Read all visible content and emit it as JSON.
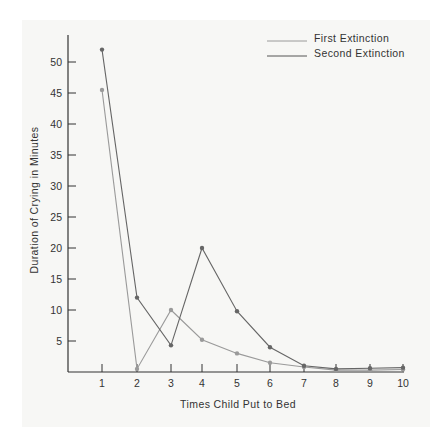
{
  "chart_data": {
    "type": "line",
    "title": "",
    "xlabel": "Times Child Put to Bed",
    "ylabel": "Duration of Crying in Minutes",
    "x": [
      1,
      2,
      3,
      4,
      5,
      6,
      7,
      8,
      9,
      10
    ],
    "x_ticks": [
      "1",
      "2",
      "3",
      "4",
      "5",
      "6",
      "7",
      "8",
      "9",
      "10"
    ],
    "y_ticks": [
      "5",
      "10",
      "15",
      "20",
      "25",
      "30",
      "35",
      "40",
      "45",
      "50"
    ],
    "ylim": [
      0,
      54
    ],
    "xlim": [
      0,
      10
    ],
    "grid": false,
    "legend_position": "top-right",
    "series": [
      {
        "name": "First Extinction",
        "color": "#9a9a9a",
        "values": [
          45.5,
          0.5,
          10,
          5.2,
          3,
          1.5,
          0.8,
          0.3,
          0.3,
          0.4
        ]
      },
      {
        "name": "Second Extinction",
        "color": "#666666",
        "values": [
          52,
          12,
          4.3,
          20,
          9.8,
          4,
          1,
          0.5,
          0.6,
          0.7
        ]
      }
    ]
  },
  "legend": {
    "first": "First Extinction",
    "second": "Second Extinction"
  },
  "axes": {
    "xlabel": "Times Child Put to Bed",
    "ylabel": "Duration of Crying in Minutes"
  }
}
